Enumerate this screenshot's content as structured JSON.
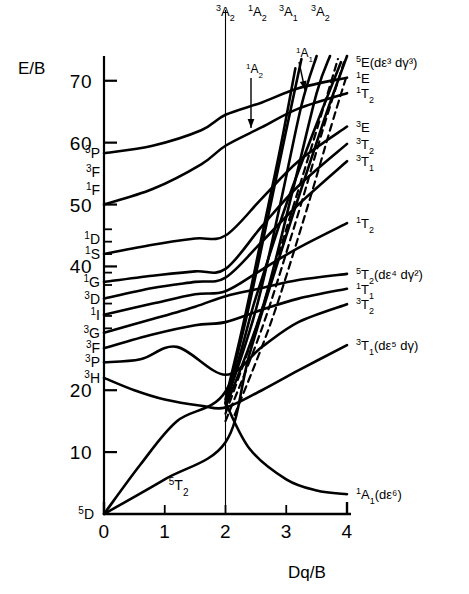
{
  "figure": {
    "kind": "tanabe-sugano-diagram",
    "axis_y_title": "E/B",
    "axis_x_title": "Dq/B",
    "ink_color": "#000000",
    "background_color": "#ffffff"
  },
  "axes": {
    "y": {
      "title": "E/B",
      "ticks": [
        10,
        20,
        40,
        50,
        60,
        70
      ],
      "tick_labels": [
        "10",
        "20",
        "40",
        "50",
        "60",
        "70"
      ],
      "min": 0,
      "max": 74,
      "minor_ticks": [
        37,
        39,
        42,
        44,
        46,
        30,
        32,
        34
      ]
    },
    "x": {
      "title": "Dq/B",
      "ticks": [
        0,
        1,
        2,
        3,
        4
      ],
      "tick_labels": [
        "0",
        "1",
        "2",
        "3",
        "4"
      ],
      "min": 0,
      "max": 4
    }
  },
  "free_ion_terms": [
    {
      "label": "3P",
      "mult": "3",
      "term": "P",
      "energy": 58.3
    },
    {
      "label": "3F",
      "mult": "3",
      "term": "F",
      "energy": 55.2
    },
    {
      "label": "1F",
      "mult": "1",
      "term": "F",
      "energy": 52.4
    },
    {
      "label": "1D",
      "mult": "1",
      "term": "D",
      "energy": 44.4
    },
    {
      "label": "1S",
      "mult": "1",
      "term": "S",
      "energy": 42.0
    },
    {
      "label": "1G",
      "mult": "1",
      "term": "G",
      "energy": 37.5
    },
    {
      "label": "3D",
      "mult": "3",
      "term": "D",
      "energy": 34.8
    },
    {
      "label": "1I",
      "mult": "1",
      "term": "I",
      "energy": 32.2
    },
    {
      "label": "3G",
      "mult": "3",
      "term": "G",
      "energy": 29.3
    },
    {
      "label": "3F",
      "mult": "3",
      "term": "F",
      "energy": 26.8
    },
    {
      "label": "3P",
      "mult": "3",
      "term": "P",
      "energy": 24.5
    },
    {
      "label": "3H",
      "mult": "3",
      "term": "H",
      "energy": 22.0
    },
    {
      "label": "5D",
      "mult": "5",
      "term": "D",
      "energy": 0.0
    }
  ],
  "top_labels": [
    {
      "mult": "3",
      "term": "A",
      "sub": "2"
    },
    {
      "mult": "1",
      "term": "A",
      "sub": "2"
    },
    {
      "mult": "3",
      "term": "A",
      "sub": "1"
    },
    {
      "mult": "3",
      "term": "A",
      "sub": "2"
    }
  ],
  "annotations": [
    {
      "mult": "1",
      "term": "A",
      "sub": "2",
      "has_arrow": true
    },
    {
      "mult": "1",
      "term": "A",
      "sub": "1",
      "has_arrow": true
    }
  ],
  "right_labels": [
    {
      "mult": "5",
      "term": "E",
      "sub": "",
      "config": "(dε³ dγ³)",
      "energy": 73.0
    },
    {
      "mult": "1",
      "term": "E",
      "sub": "",
      "config": "",
      "energy": 70.5
    },
    {
      "mult": "1",
      "term": "T",
      "sub": "2",
      "config": "",
      "energy": 68.0
    },
    {
      "mult": "3",
      "term": "E",
      "sub": "",
      "config": "",
      "energy": 62.6
    },
    {
      "mult": "3",
      "term": "T",
      "sub": "2",
      "config": "",
      "energy": 59.8
    },
    {
      "mult": "3",
      "term": "T",
      "sub": "1",
      "config": "",
      "energy": 57.0
    },
    {
      "mult": "1",
      "term": "T",
      "sub": "2",
      "config": "",
      "energy": 47.0
    },
    {
      "mult": "5",
      "term": "T",
      "sub": "2",
      "config": "(dε⁴ dγ²)",
      "energy": 38.8
    },
    {
      "mult": "1",
      "term": "T",
      "sub": "1",
      "config": "",
      "energy": 36.4
    },
    {
      "mult": "3",
      "term": "T",
      "sub": "2",
      "config": "",
      "energy": 33.9
    },
    {
      "mult": "3",
      "term": "T",
      "sub": "1",
      "config": "(dε⁵ dγ)",
      "energy": 27.3
    },
    {
      "mult": "1",
      "term": "A",
      "sub": "1",
      "config": "(dε⁶)",
      "energy": 3.2
    }
  ],
  "ground_state_label": {
    "mult": "5",
    "term": "T",
    "sub": "2",
    "x": 1.0,
    "y": 2.6
  },
  "chart_data": {
    "type": "line",
    "title": "",
    "xlabel": "Dq/B",
    "ylabel": "E/B",
    "xlim": [
      0,
      4
    ],
    "ylim": [
      0,
      74
    ],
    "grid": false,
    "legend": "none",
    "crossover_x": 2.0,
    "series": [
      {
        "name": "5T2 -> 5E (high spin ground, kink at 2)",
        "style": "solid",
        "points": [
          [
            0,
            0
          ],
          [
            1,
            5.6
          ],
          [
            2,
            11.6
          ],
          [
            2.4,
            26.0
          ],
          [
            3,
            45.0
          ],
          [
            3.6,
            63.0
          ],
          [
            4,
            74.0
          ]
        ]
      },
      {
        "name": "5E (d-eps3 d-gam3)",
        "style": "solid",
        "points": [
          [
            0,
            0
          ],
          [
            0.6,
            8.0
          ],
          [
            1.2,
            15.0
          ],
          [
            2,
            19.8
          ],
          [
            2.5,
            35.0
          ],
          [
            3,
            50.0
          ],
          [
            3.5,
            63.0
          ],
          [
            3.9,
            73.0
          ]
        ]
      },
      {
        "name": "1A1 (d-eps6) ground after crossover",
        "style": "solid",
        "points": [
          [
            2,
            18.0
          ],
          [
            2.4,
            10.5
          ],
          [
            3,
            5.6
          ],
          [
            3.5,
            3.8
          ],
          [
            4,
            3.2
          ]
        ]
      },
      {
        "name": "3T1 (d-eps5 d-gam)",
        "style": "solid",
        "points": [
          [
            0,
            22.0
          ],
          [
            0.5,
            20.0
          ],
          [
            1.0,
            18.5
          ],
          [
            1.6,
            17.5
          ],
          [
            2,
            17.2
          ],
          [
            2.6,
            20.0
          ],
          [
            3.2,
            23.2
          ],
          [
            4,
            27.3
          ]
        ]
      },
      {
        "name": "3T2",
        "style": "solid",
        "points": [
          [
            0,
            24.5
          ],
          [
            0.6,
            25.0
          ],
          [
            1.2,
            27.0
          ],
          [
            2,
            22.5
          ],
          [
            2.6,
            27.0
          ],
          [
            3.2,
            31.0
          ],
          [
            4,
            33.9
          ]
        ]
      },
      {
        "name": "1T1",
        "style": "solid",
        "points": [
          [
            0,
            26.8
          ],
          [
            0.8,
            29.0
          ],
          [
            1.5,
            30.5
          ],
          [
            2,
            31.0
          ],
          [
            2.6,
            33.0
          ],
          [
            3.2,
            34.8
          ],
          [
            4,
            36.4
          ]
        ]
      },
      {
        "name": "5T2 (d-eps4 d-gam2)",
        "style": "solid",
        "points": [
          [
            0,
            29.3
          ],
          [
            0.8,
            31.5
          ],
          [
            1.5,
            33.5
          ],
          [
            2,
            35.2
          ],
          [
            2.6,
            36.5
          ],
          [
            3.2,
            37.8
          ],
          [
            4,
            38.8
          ]
        ]
      },
      {
        "name": "1T2",
        "style": "solid",
        "points": [
          [
            0,
            32.2
          ],
          [
            0.8,
            34.0
          ],
          [
            1.5,
            35.5
          ],
          [
            2,
            36.0
          ],
          [
            2.6,
            39.5
          ],
          [
            3.2,
            43.0
          ],
          [
            4,
            47.0
          ]
        ]
      },
      {
        "name": "3T1 upper",
        "style": "solid",
        "points": [
          [
            0,
            34.8
          ],
          [
            0.8,
            36.5
          ],
          [
            1.5,
            37.5
          ],
          [
            2,
            38.2
          ],
          [
            2.6,
            44.0
          ],
          [
            3.2,
            50.0
          ],
          [
            4,
            57.0
          ]
        ]
      },
      {
        "name": "3T2 upper",
        "style": "solid",
        "points": [
          [
            0,
            37.5
          ],
          [
            0.8,
            38.5
          ],
          [
            1.5,
            39.2
          ],
          [
            2,
            39.6
          ],
          [
            2.6,
            46.5
          ],
          [
            3.2,
            53.0
          ],
          [
            4,
            59.8
          ]
        ]
      },
      {
        "name": "3E",
        "style": "solid",
        "points": [
          [
            0,
            42.0
          ],
          [
            0.8,
            43.5
          ],
          [
            1.5,
            44.5
          ],
          [
            2,
            45.0
          ],
          [
            2.6,
            51.0
          ],
          [
            3.2,
            57.0
          ],
          [
            4,
            62.6
          ]
        ]
      },
      {
        "name": "1T2 high",
        "style": "solid",
        "points": [
          [
            0,
            50.0
          ],
          [
            0.8,
            52.5
          ],
          [
            1.6,
            56.5
          ],
          [
            2,
            59.5
          ],
          [
            2.6,
            62.5
          ],
          [
            3.2,
            65.5
          ],
          [
            4,
            68.0
          ]
        ]
      },
      {
        "name": "1E",
        "style": "solid",
        "points": [
          [
            0,
            58.3
          ],
          [
            0.8,
            59.5
          ],
          [
            1.6,
            62.0
          ],
          [
            2,
            64.5
          ],
          [
            2.6,
            66.5
          ],
          [
            3.2,
            68.8
          ],
          [
            4,
            70.5
          ]
        ]
      },
      {
        "name": "3A2 steep a",
        "style": "solid",
        "points": [
          [
            2,
            18.5
          ],
          [
            2.3,
            31.0
          ],
          [
            2.6,
            45.0
          ],
          [
            2.9,
            59.0
          ],
          [
            3.15,
            72.0
          ]
        ]
      },
      {
        "name": "1A2 steep b",
        "style": "solid",
        "points": [
          [
            2,
            18.0
          ],
          [
            2.35,
            32.0
          ],
          [
            2.7,
            48.0
          ],
          [
            3.0,
            62.0
          ],
          [
            3.25,
            73.5
          ]
        ]
      },
      {
        "name": "3A1 steep c",
        "style": "solid",
        "points": [
          [
            2,
            17.8
          ],
          [
            2.5,
            33.0
          ],
          [
            2.9,
            50.0
          ],
          [
            3.25,
            66.0
          ],
          [
            3.5,
            74.0
          ]
        ]
      },
      {
        "name": "3A2 steep d",
        "style": "solid",
        "points": [
          [
            2,
            17.2
          ],
          [
            2.6,
            33.0
          ],
          [
            3.1,
            52.0
          ],
          [
            3.5,
            68.0
          ],
          [
            3.72,
            74.0
          ]
        ]
      },
      {
        "name": "spin-forbidden dashed 1",
        "style": "dashed",
        "points": [
          [
            2,
            16.2
          ],
          [
            2.5,
            30.0
          ],
          [
            3.0,
            46.0
          ],
          [
            3.5,
            62.0
          ],
          [
            3.85,
            73.5
          ]
        ]
      },
      {
        "name": "spin-forbidden dashed 2",
        "style": "dashed",
        "points": [
          [
            2,
            15.0
          ],
          [
            2.6,
            30.0
          ],
          [
            3.15,
            47.0
          ],
          [
            3.6,
            62.0
          ],
          [
            3.95,
            73.0
          ]
        ]
      },
      {
        "name": "spin-forbidden dashed 3",
        "style": "dashed",
        "points": [
          [
            2.15,
            16.0
          ],
          [
            2.75,
            31.0
          ],
          [
            3.3,
            48.0
          ],
          [
            3.75,
            63.0
          ],
          [
            4,
            71.0
          ]
        ]
      }
    ]
  }
}
